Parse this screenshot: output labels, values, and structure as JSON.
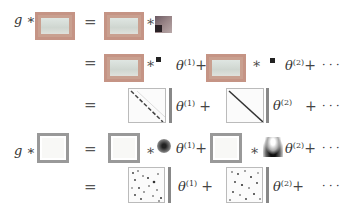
{
  "rows": [
    {
      "lhs": "g ∗",
      "eq": "=",
      "star": "∗"
    },
    {
      "eq": "=",
      "star1": "∗",
      "theta1": "θ",
      "sup1": "(1)",
      "plus1": "+",
      "star2": "∗",
      "theta2": "θ",
      "sup2": "(2)",
      "plus2": "+",
      "dots": "· · ·"
    },
    {
      "eq": "=",
      "theta1": "θ",
      "sup1": "(1)",
      "plus1": "+",
      "theta2": "θ",
      "sup2": "(2)",
      "plus2": "+",
      "dots": "· · ·"
    },
    {
      "lhs": "g ∗",
      "eq": "=",
      "star1": "∗",
      "theta1": "θ",
      "sup1": "(1)",
      "plus1": "+",
      "star2": "∗",
      "theta2": "θ",
      "sup2": "(2)",
      "plus2": "+",
      "dots": "· · ·"
    },
    {
      "eq": "=",
      "theta1": "θ",
      "sup1": "(1)",
      "plus1": "+",
      "theta2": "θ",
      "sup2": "(2)",
      "plus2": "+",
      "dots": "· · ·"
    }
  ]
}
